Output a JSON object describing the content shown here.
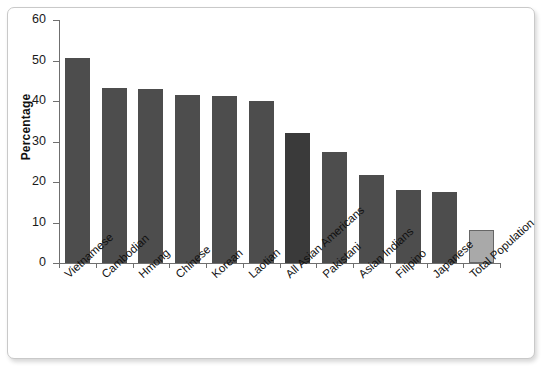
{
  "chart_data": {
    "type": "bar",
    "title": "",
    "xlabel": "",
    "ylabel": "Percentage",
    "ylim": [
      0,
      60
    ],
    "ytick_values": [
      0,
      10,
      20,
      30,
      40,
      50,
      60
    ],
    "ytick_labels": [
      "0",
      "10",
      "20",
      "30",
      "40",
      "50",
      "60"
    ],
    "grid": false,
    "legend": null,
    "categories": [
      "Vietnamese",
      "Cambodian",
      "Hmong",
      "Chinese",
      "Korean",
      "Laotian",
      "All Asian Americans",
      "Pakistani",
      "Asian Indians",
      "Filipino",
      "Japanese",
      "Total Population"
    ],
    "values": [
      50.6,
      43.3,
      43.0,
      41.4,
      41.2,
      40.0,
      32.2,
      27.3,
      21.7,
      18.0,
      17.5,
      8.2
    ],
    "bar_styles": [
      "default",
      "default",
      "default",
      "default",
      "default",
      "default",
      "highlight",
      "default",
      "default",
      "default",
      "default",
      "total"
    ],
    "colors": {
      "bar_default": "#4d4d4d",
      "bar_highlight": "#3a3a3a",
      "bar_total": "#a9a9a9",
      "axis": "#6f6f6f",
      "text": "#111111",
      "frame_border": "#c9c9c9",
      "background": "#ffffff"
    }
  }
}
